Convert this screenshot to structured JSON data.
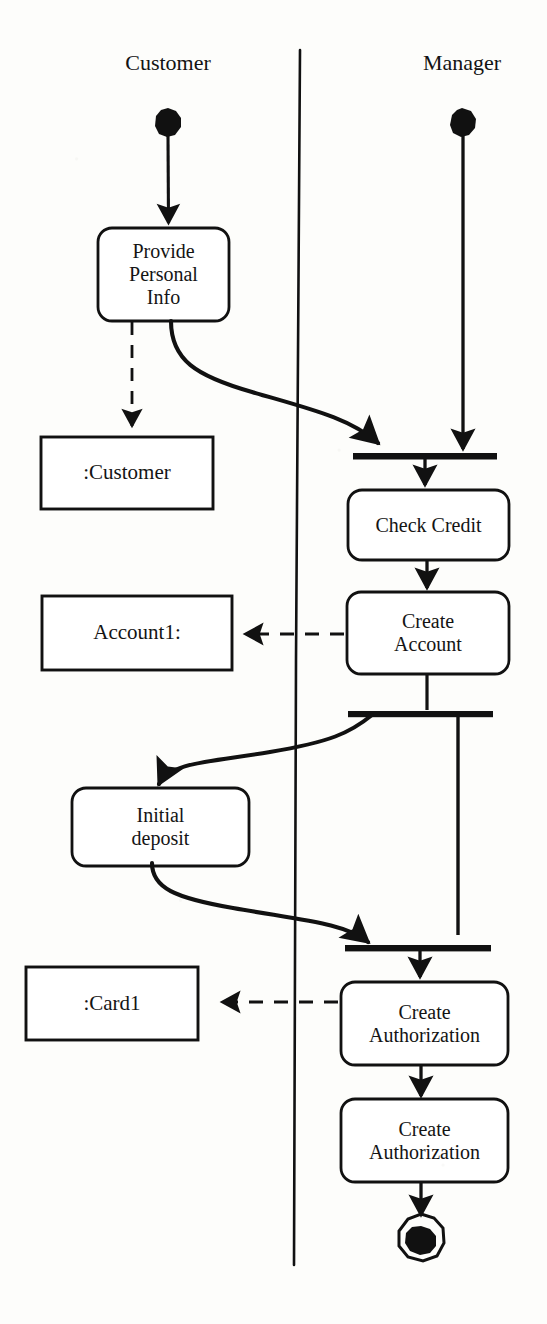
{
  "diagram": {
    "kind": "uml-activity-diagram",
    "stroke_color": "#111111",
    "fill_color": "#ffffff",
    "background_color": "#fdfdfb"
  },
  "swimlanes": [
    {
      "id": "customer",
      "label": "Customer"
    },
    {
      "id": "manager",
      "label": "Manager"
    }
  ],
  "nodes": {
    "start_customer": {
      "type": "initial-node",
      "lane": "customer"
    },
    "start_manager": {
      "type": "initial-node",
      "lane": "manager"
    },
    "provide_info": {
      "type": "activity",
      "lane": "customer",
      "label": "Provide\nPersonal\nInfo"
    },
    "customer_object": {
      "type": "object",
      "lane": "customer",
      "label": ":Customer"
    },
    "join_1": {
      "type": "join-bar",
      "lane": "manager"
    },
    "check_credit": {
      "type": "activity",
      "lane": "manager",
      "label": "Check Credit"
    },
    "create_account": {
      "type": "activity",
      "lane": "manager",
      "label": "Create\nAccount"
    },
    "account1_object": {
      "type": "object",
      "lane": "customer",
      "label": "Account1:"
    },
    "fork_1": {
      "type": "fork-bar",
      "lane": "manager"
    },
    "initial_deposit": {
      "type": "activity",
      "lane": "customer",
      "label": "Initial\ndeposit"
    },
    "join_2": {
      "type": "join-bar",
      "lane": "manager"
    },
    "create_auth_1": {
      "type": "activity",
      "lane": "manager",
      "label": "Create\nAuthorization"
    },
    "card1_object": {
      "type": "object",
      "lane": "customer",
      "label": ":Card1"
    },
    "create_auth_2": {
      "type": "activity",
      "lane": "manager",
      "label": "Create\nAuthorization"
    },
    "final_node": {
      "type": "final-node",
      "lane": "manager"
    }
  },
  "edges": [
    {
      "from": "start_customer",
      "to": "provide_info",
      "style": "solid",
      "shape": "straight"
    },
    {
      "from": "start_manager",
      "to": "join_1",
      "style": "solid",
      "shape": "straight"
    },
    {
      "from": "provide_info",
      "to": "customer_object",
      "style": "dashed",
      "shape": "straight"
    },
    {
      "from": "provide_info",
      "to": "join_1",
      "style": "solid",
      "shape": "curved"
    },
    {
      "from": "join_1",
      "to": "check_credit",
      "style": "solid",
      "shape": "straight"
    },
    {
      "from": "check_credit",
      "to": "create_account",
      "style": "solid",
      "shape": "straight"
    },
    {
      "from": "create_account",
      "to": "account1_object",
      "style": "dashed",
      "shape": "straight"
    },
    {
      "from": "create_account",
      "to": "fork_1",
      "style": "solid",
      "shape": "straight"
    },
    {
      "from": "fork_1",
      "to": "initial_deposit",
      "style": "solid",
      "shape": "curved"
    },
    {
      "from": "fork_1",
      "to": "join_2",
      "style": "solid",
      "shape": "straight"
    },
    {
      "from": "initial_deposit",
      "to": "join_2",
      "style": "solid",
      "shape": "curved"
    },
    {
      "from": "join_2",
      "to": "create_auth_1",
      "style": "solid",
      "shape": "straight"
    },
    {
      "from": "create_auth_1",
      "to": "card1_object",
      "style": "dashed",
      "shape": "straight"
    },
    {
      "from": "create_auth_1",
      "to": "create_auth_2",
      "style": "solid",
      "shape": "straight"
    },
    {
      "from": "create_auth_2",
      "to": "final_node",
      "style": "solid",
      "shape": "straight"
    }
  ]
}
